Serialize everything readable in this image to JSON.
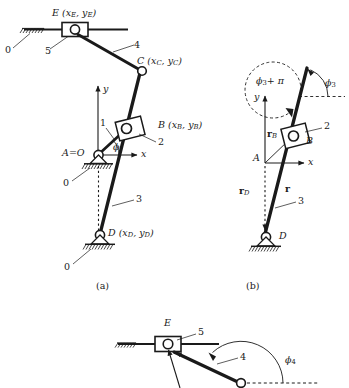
{
  "figure": {
    "background_color": "#ffffff",
    "ink_color": "#1a1a1a",
    "panels": [
      {
        "id": "a",
        "label": "(a)",
        "caption": "Mechanism with global coordinates"
      },
      {
        "id": "b",
        "label": "(b)",
        "caption": "Position vectors and angle phi3 for link 3"
      },
      {
        "id": "c",
        "label": "(c)",
        "caption": "Slider E detail with angle phi4 for link 4"
      }
    ]
  },
  "panel_a": {
    "points": {
      "E": "E (x_E, y_E)",
      "C": "C (x_C, y_C)",
      "B": "B (x_B, y_B)",
      "D": "D (x_D, y_D)",
      "A": "A=O"
    },
    "link_numbers": {
      "ground_top": "0",
      "ground_A": "0",
      "ground_D": "0",
      "slider_E": "5",
      "link_4": "4",
      "link_1": "1",
      "slider_2": "2",
      "link_3": "3"
    },
    "axes": {
      "x": "x",
      "y": "y"
    },
    "angle": "ϕ",
    "panel_label": "(a)"
  },
  "panel_b": {
    "points": {
      "A": "A",
      "B": "B",
      "D": "D"
    },
    "vectors": {
      "r_B": "r_B",
      "r_D": "r_D",
      "r": "r"
    },
    "angles": {
      "phi3": "ϕ₃",
      "phi3_plus_pi": "ϕ₃ + π"
    },
    "link_numbers": {
      "slider_2": "2",
      "link_3": "3"
    },
    "axes": {
      "x": "x",
      "y": "y"
    },
    "panel_label": "(b)"
  },
  "panel_c": {
    "points": {
      "E": "E"
    },
    "link_numbers": {
      "slider_5": "5",
      "link_4": "4"
    },
    "angles": {
      "phi4": "ϕ₄"
    }
  }
}
